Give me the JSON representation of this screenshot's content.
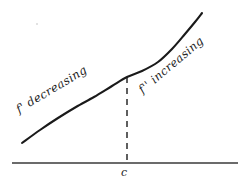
{
  "figure": {
    "title": "",
    "background_color": "#ffffff",
    "ink_color": "#1c1c1c",
    "labels": {
      "left_label": "f' decreasing",
      "right_label": "f'' increasing",
      "x_mark": "c"
    },
    "icons": {
      "curve": "curve-icon",
      "axis": "horizontal-axis-icon",
      "dashed": "dashed-vertical-line-icon"
    }
  },
  "chart_data": {
    "type": "line",
    "title": "",
    "subtitle": "",
    "xlabel": "",
    "ylabel": "",
    "grid": false,
    "legend_position": "none",
    "axis": {
      "x_axis_y_pixel": 163,
      "x_axis_start_px": 12,
      "x_axis_end_px": 238,
      "y_axis_shown": false
    },
    "annotations": [
      {
        "name": "left-region-label",
        "text": "f' decreasing",
        "rotation_deg": -31,
        "x_px": 17,
        "y_px": 103
      },
      {
        "name": "right-region-label",
        "text": "f'' increasing",
        "rotation_deg": -40,
        "x_px": 140,
        "y_px": 84
      },
      {
        "name": "inflection-tick-label",
        "text": "c",
        "rotation_deg": 0,
        "x_px": 121,
        "y_px": 166
      }
    ],
    "inflection_point": {
      "label": "c",
      "x_px": 127,
      "y_px": 77
    },
    "dashed_line": {
      "x_px": 127,
      "y_top_px": 77,
      "y_bottom_px": 163,
      "dash_pattern": "6,5"
    },
    "x": [
      22,
      40,
      58,
      76,
      94,
      112,
      127,
      142,
      158,
      172,
      185,
      195,
      202
    ],
    "y": [
      143,
      130,
      118,
      107,
      97,
      86,
      77,
      71,
      62,
      49,
      34,
      22,
      13
    ],
    "series": [
      {
        "name": "f",
        "values": [
          143,
          130,
          118,
          107,
          97,
          86,
          77,
          71,
          62,
          49,
          34,
          22,
          13
        ]
      }
    ],
    "xlim": [
      12,
      238
    ],
    "ylim": [
      188,
      0
    ]
  }
}
